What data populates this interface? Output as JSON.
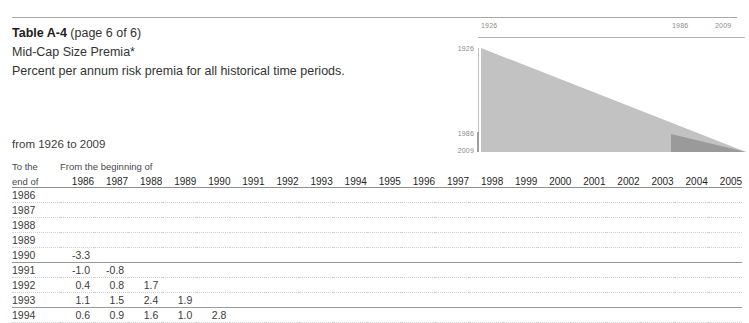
{
  "document": {
    "title_main": "Table A-4",
    "title_suffix": " (page 6 of 6)",
    "subtitle": "Mid-Cap Size Premia*",
    "description": "Percent per annum risk premia for all historical time periods.",
    "range_label": "from 1926 to 2009"
  },
  "chart_data": {
    "type": "area",
    "title": "",
    "xlabel": "",
    "ylabel": "",
    "x_tick_labels": [
      "1926",
      "1986",
      "2009"
    ],
    "y_tick_labels": [
      "1926",
      "1986",
      "2009"
    ],
    "xlim": [
      1926,
      2009
    ],
    "ylim": [
      1926,
      2009
    ],
    "grid": false,
    "legend": "none",
    "series": [
      {
        "name": "full-coverage-triangle",
        "color": "#c2c2c2",
        "polygon": [
          [
            1926,
            1926
          ],
          [
            2009,
            2009
          ],
          [
            1926,
            2009
          ]
        ]
      },
      {
        "name": "this-page-wedge",
        "color": "#9a9a9a",
        "polygon": [
          [
            1986,
            1986
          ],
          [
            2009,
            2009
          ],
          [
            1986,
            2009
          ]
        ]
      }
    ]
  },
  "table": {
    "corner_header_line1": "To the",
    "corner_header_line2": "end of",
    "group_header": "From the beginning of",
    "columns": [
      "1986",
      "1987",
      "1988",
      "1989",
      "1990",
      "1991",
      "1992",
      "1993",
      "1994",
      "1995",
      "1996",
      "1997",
      "1998",
      "1999",
      "2000",
      "2001",
      "2002",
      "2003",
      "2004",
      "2005"
    ],
    "rows": [
      {
        "label": "1986",
        "values": []
      },
      {
        "label": "1987",
        "values": []
      },
      {
        "label": "1988",
        "values": []
      },
      {
        "label": "1989",
        "values": []
      },
      {
        "label": "1990",
        "values": [
          "-3.3"
        ]
      },
      {
        "label": "1991",
        "values": [
          "-1.0",
          "-0.8"
        ]
      },
      {
        "label": "1992",
        "values": [
          "0.4",
          "0.8",
          "1.7"
        ]
      },
      {
        "label": "1993",
        "values": [
          "1.1",
          "1.5",
          "2.4",
          "1.9"
        ]
      },
      {
        "label": "1994",
        "values": [
          "0.6",
          "0.9",
          "1.6",
          "1.0",
          "2.8"
        ]
      }
    ],
    "emphasized_row_labels": [
      "1990",
      "1993"
    ]
  }
}
